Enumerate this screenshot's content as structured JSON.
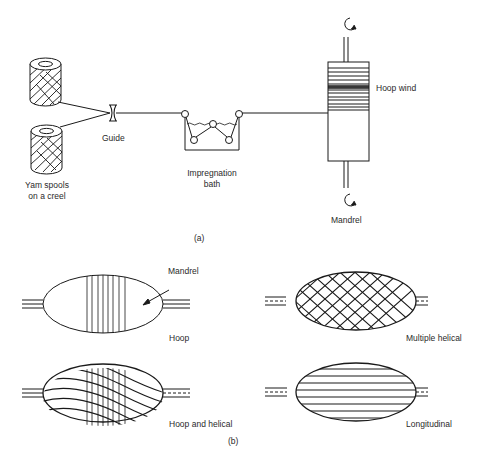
{
  "figure": {
    "part_a": {
      "caption": "(a)",
      "labels": {
        "spools_line1": "Yam spools",
        "spools_line2": "on a creel",
        "guide": "Guide",
        "bath_line1": "Impregnation",
        "bath_line2": "bath",
        "hoop_wind": "Hoop wind",
        "mandrel": "Mandrel"
      }
    },
    "part_b": {
      "caption": "(b)",
      "patterns": [
        {
          "name": "Hoop",
          "pointer_label": "Mandrel"
        },
        {
          "name": "Multiple helical"
        },
        {
          "name": "Hoop and helical"
        },
        {
          "name": "Longitudinal"
        }
      ]
    }
  },
  "colors": {
    "line": "#1a1a1a",
    "background": "#ffffff"
  }
}
